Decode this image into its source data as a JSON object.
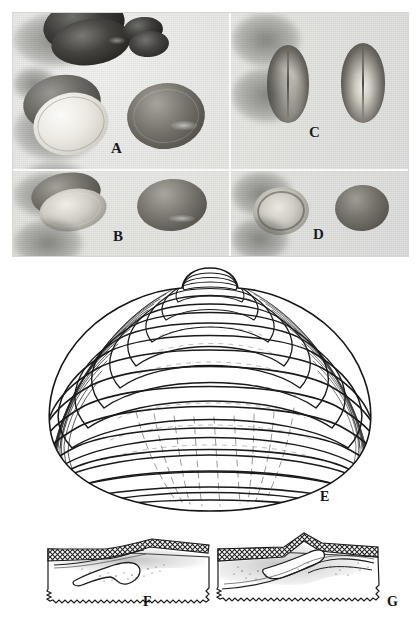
{
  "figure": {
    "kind": "scientific-plate",
    "panel_labels": [
      "A",
      "B",
      "C",
      "D",
      "E",
      "F",
      "G"
    ],
    "background_color": "#ffffff"
  },
  "photo_plate": {
    "name": "specimen-photograph-plate",
    "background_color": "#e7e7e4",
    "border_color": "#d8d8d4",
    "quadrants": [
      {
        "id": "A",
        "label": "A",
        "name": "photo-quadrant-a",
        "specimen_count": 4,
        "view": "exterior and interior valves, assorted sizes"
      },
      {
        "id": "B",
        "label": "B",
        "name": "photo-quadrant-b",
        "specimen_count": 2,
        "view": "paired valves, lateral"
      },
      {
        "id": "C",
        "label": "C",
        "name": "photo-quadrant-c",
        "specimen_count": 2,
        "view": "closed shells, dorsal edge-on"
      },
      {
        "id": "D",
        "label": "D",
        "name": "photo-quadrant-d",
        "specimen_count": 2,
        "view": "interior and exterior valve"
      }
    ]
  },
  "drawing": {
    "id": "E",
    "label": "E",
    "name": "shell-exterior-line-drawing",
    "description": "exterior of left valve with concentric growth lines and prominent umbo",
    "growth_ring_count": 17,
    "ink_color": "#1a1a1a",
    "fill_color": "#ffffff"
  },
  "hinge_diagrams": [
    {
      "id": "F",
      "label": "F",
      "name": "hinge-detail-f",
      "description": "hinge region cross-section with cross-hatched periostracum band and chondrophore",
      "hatch_color": "#2a2a2a",
      "stipple_color": "#6a6a6a"
    },
    {
      "id": "G",
      "label": "G",
      "name": "hinge-detail-g",
      "description": "hinge region cross-section with cross-hatched band, cardinal tooth and ligament pit",
      "hatch_color": "#2a2a2a",
      "stipple_color": "#6a6a6a"
    }
  ]
}
